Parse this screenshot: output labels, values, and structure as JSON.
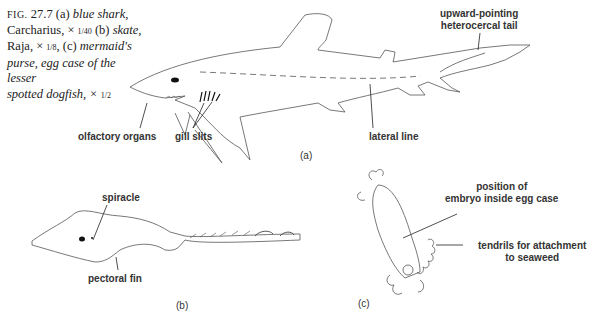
{
  "caption": {
    "fig_prefix": "FIG.",
    "fig_number": "27.7",
    "line1_a": "(a)",
    "line1_b": "blue shark",
    "line2_a": "Carcharius, ×",
    "scale_a": "1/40",
    "line2_b": "(b)",
    "line2_c": "skate,",
    "line3_a": "Raja, ×",
    "scale_b": "1/8",
    "line3_b": ", (c)",
    "line3_c": "mermaid's",
    "line4": "purse, egg case of the lesser",
    "line5": "spotted dogfish, ×",
    "scale_c": "1/2"
  },
  "panels": {
    "a": {
      "id": "(a)",
      "subject": "blue shark",
      "labels": {
        "tail": [
          "upward-pointing",
          "heterocercal tail"
        ],
        "olfactory": "olfactory organs",
        "gills": "gill slits",
        "lateral": "lateral line"
      }
    },
    "b": {
      "id": "(b)",
      "subject": "skate",
      "labels": {
        "spiracle": "spiracle",
        "pectoral": "pectoral fin"
      }
    },
    "c": {
      "id": "(c)",
      "subject": "mermaid's purse",
      "labels": {
        "embryo": [
          "position of",
          "embryo inside egg case"
        ],
        "tendrils": [
          "tendrils for attachment",
          "to seaweed"
        ]
      }
    }
  }
}
